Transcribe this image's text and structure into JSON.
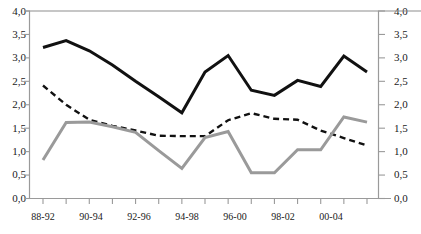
{
  "chart_data": {
    "type": "line",
    "title": "",
    "subtitle": "",
    "xlabel": "",
    "ylabel": "",
    "ylim": [
      0.0,
      4.0
    ],
    "y_ticks": [
      "0,0",
      "0,5",
      "1,0",
      "1,5",
      "2,0",
      "2,5",
      "3,0",
      "3,5",
      "4,0"
    ],
    "y_tick_values": [
      0.0,
      0.5,
      1.0,
      1.5,
      2.0,
      2.5,
      3.0,
      3.5,
      4.0
    ],
    "right_axis_ticks": [
      "0,0",
      "0,5",
      "1,0",
      "1,5",
      "2,0",
      "2,5",
      "3,0",
      "3,5",
      "4,0"
    ],
    "right_axis_same_scale": true,
    "grid": false,
    "legend": "none",
    "categories": [
      "88-92",
      "89-93",
      "90-94",
      "91-95",
      "92-96",
      "93-97",
      "94-98",
      "95-99",
      "96-00",
      "97-01",
      "98-02",
      "99-03",
      "00-04",
      "01-05",
      "02-06"
    ],
    "visible_tick_labels": [
      "88-92",
      "90-94",
      "92-96",
      "94-98",
      "96-00",
      "98-02",
      "00-04"
    ],
    "visible_tick_label_indices": [
      0,
      2,
      4,
      6,
      8,
      10,
      12
    ],
    "series": [
      {
        "name": "solid-black-series",
        "style": "solid",
        "color": "#111111",
        "width": 3.0,
        "values": [
          3.22,
          3.37,
          3.15,
          2.85,
          2.5,
          2.17,
          1.83,
          2.7,
          3.05,
          2.31,
          2.2,
          2.52,
          2.39,
          3.04,
          2.7
        ]
      },
      {
        "name": "dashed-black-series",
        "style": "dashed",
        "color": "#111111",
        "width": 2.4,
        "values": [
          2.41,
          2.0,
          1.68,
          1.55,
          1.45,
          1.34,
          1.33,
          1.33,
          1.67,
          1.82,
          1.7,
          1.68,
          1.45,
          1.29,
          1.13
        ]
      },
      {
        "name": "solid-gray-series",
        "style": "solid",
        "color": "#9a9a9a",
        "width": 3.0,
        "values": [
          0.82,
          1.62,
          1.63,
          1.53,
          1.41,
          1.02,
          0.64,
          1.3,
          1.43,
          0.55,
          0.55,
          1.04,
          1.04,
          1.74,
          1.63
        ]
      }
    ]
  },
  "axes": {
    "left_axis_name": "left-value-axis",
    "right_axis_name": "right-value-axis",
    "bottom_axis_name": "period-category-axis"
  }
}
